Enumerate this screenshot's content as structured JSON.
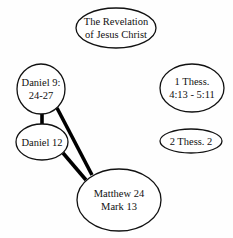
{
  "diagram": {
    "nodes": [
      {
        "id": "revelation",
        "lines": [
          "The Revelation",
          "of Jesus Christ"
        ],
        "cx": 116,
        "cy": 28,
        "rx": 40,
        "ry": 20
      },
      {
        "id": "daniel9",
        "lines": [
          "Daniel 9:",
          "24-27"
        ],
        "cx": 41,
        "cy": 89,
        "rx": 24,
        "ry": 25
      },
      {
        "id": "thess1",
        "lines": [
          "1 Thess.",
          "4:13 - 5:11"
        ],
        "cx": 192,
        "cy": 88,
        "rx": 32,
        "ry": 24
      },
      {
        "id": "daniel12",
        "lines": [
          "Daniel 12"
        ],
        "cx": 42,
        "cy": 142,
        "rx": 26,
        "ry": 18
      },
      {
        "id": "thess2",
        "lines": [
          "2 Thess. 2"
        ],
        "cx": 191,
        "cy": 141,
        "rx": 31,
        "ry": 12
      },
      {
        "id": "matthew",
        "lines": [
          "Matthew 24",
          "Mark 13"
        ],
        "cx": 119,
        "cy": 200,
        "rx": 42,
        "ry": 31
      }
    ],
    "edges": [
      {
        "from": "daniel9",
        "to": "daniel12"
      },
      {
        "from": "daniel9",
        "to": "matthew"
      },
      {
        "from": "daniel12",
        "to": "matthew"
      }
    ]
  }
}
